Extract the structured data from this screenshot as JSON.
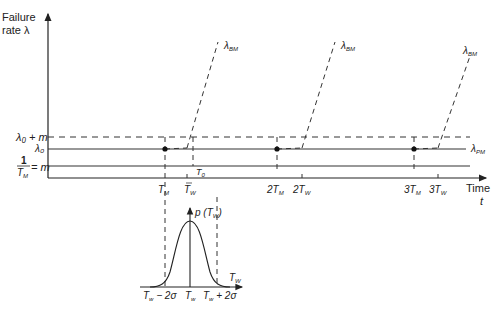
{
  "diagram": {
    "y_axis": {
      "label_line1": "Failure",
      "label_line2": "rate λ"
    },
    "x_axis": {
      "label_line1": "Time",
      "label_line2": "t"
    },
    "levels": {
      "upper_dashed": "λ₀ + m",
      "lambda0": "λ₀",
      "m_numerator": "1",
      "m_denominator": "T",
      "m_denominator_sub": "M",
      "m_equals": "= m"
    },
    "curve_labels": {
      "bm": "λ",
      "bm_sub": "BM",
      "pm": "λ",
      "pm_sub": "PM"
    },
    "ticks": [
      {
        "text": "T",
        "sub": "M",
        "prefix": ""
      },
      {
        "text": "T",
        "sub": "W",
        "prefix": "",
        "bar": true
      },
      {
        "text": "T",
        "sub": "0",
        "prefix": ""
      },
      {
        "text": "T",
        "sub": "M",
        "prefix": "2"
      },
      {
        "text": "T",
        "sub": "W",
        "prefix": "2",
        "bar": true
      },
      {
        "text": "T",
        "sub": "M",
        "prefix": "3"
      },
      {
        "text": "T",
        "sub": "W",
        "prefix": "3",
        "bar": true
      }
    ],
    "distribution": {
      "y_label": "p (T",
      "y_label_sub": "W",
      "x_label": "T",
      "x_label_sub": "W",
      "left_bound": "T",
      "left_bound_sub": "w",
      "left_bound_suffix": " − 2σ",
      "center": "T",
      "center_sub": "w",
      "right_bound": "T",
      "right_bound_sub": "w",
      "right_bound_suffix": " + 2σ"
    }
  }
}
